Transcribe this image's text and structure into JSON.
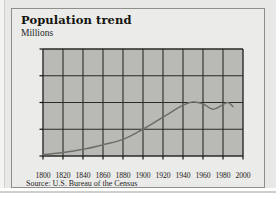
{
  "card": {
    "title": "Population trend",
    "subtitle": "Millions",
    "source": "Source: U.S. Bureau of the Census"
  },
  "colors": {
    "card_background": "#ebebe9",
    "card_border": "#8e8e8b",
    "plot_background": "#b9b9b6",
    "gridline": "#2a2a26",
    "axis": "#14130f",
    "series_line": "#6e6e68",
    "text": "#14130f",
    "page_background": "#e8e8e6"
  },
  "chart_data": {
    "type": "line",
    "title": "Population trend",
    "subtitle": "Millions",
    "xlabel": "",
    "ylabel": "Millions",
    "xlim": [
      1800,
      2000
    ],
    "ylim": [
      0,
      4
    ],
    "xticks": [
      1800,
      1820,
      1840,
      1860,
      1880,
      1900,
      1920,
      1940,
      1960,
      1980,
      2000
    ],
    "yticks": [
      0,
      1,
      2,
      3,
      4
    ],
    "grid": true,
    "legend": null,
    "legend_position": "none",
    "source": "Source: U.S. Bureau of the Census",
    "series": [
      {
        "name": "Population",
        "x": [
          1800,
          1820,
          1840,
          1860,
          1880,
          1900,
          1920,
          1940,
          1950,
          1960,
          1970,
          1980,
          1985,
          1990
        ],
        "values": [
          0.05,
          0.13,
          0.25,
          0.42,
          0.62,
          1.0,
          1.45,
          1.9,
          2.02,
          1.95,
          1.75,
          1.92,
          2.0,
          1.85
        ]
      }
    ]
  }
}
